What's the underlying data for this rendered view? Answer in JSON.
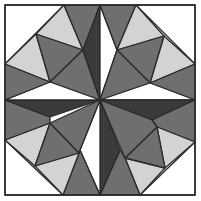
{
  "colors": {
    "white": "#ffffff",
    "light": "#d3d3d3",
    "medium": "#6f6f6f",
    "dark": "#3b3b3b",
    "line": "#2a2a2a"
  },
  "frame": {
    "x": 5,
    "y": 5,
    "w": 190,
    "h": 190
  },
  "triangles": [
    {
      "region": "tl-corner",
      "fill": "white",
      "points": "5,5 64,5 5,64"
    },
    {
      "region": "tl-light-top",
      "fill": "light",
      "points": "64,5 36,34 83,50"
    },
    {
      "region": "tl-light-left",
      "fill": "light",
      "points": "5,64 36,34 50,82"
    },
    {
      "region": "tl-mid",
      "fill": "medium",
      "points": "36,34 83,50 50,82"
    },
    {
      "region": "tl-inner",
      "fill": "medium",
      "points": "83,50 50,82 100,100"
    },
    {
      "region": "top-gray-left",
      "fill": "medium",
      "points": "64,5 100,5 83,50"
    },
    {
      "region": "top-dark",
      "fill": "dark",
      "points": "100,5 83,50 100,100"
    },
    {
      "region": "top-white",
      "fill": "white",
      "points": "100,5 100,100 117,50"
    },
    {
      "region": "top-gray-right",
      "fill": "medium",
      "points": "100,5 136,5 117,50"
    },
    {
      "region": "tr-corner",
      "fill": "white",
      "points": "136,5 195,5 195,64"
    },
    {
      "region": "tr-light-top",
      "fill": "light",
      "points": "136,5 164,36 117,50"
    },
    {
      "region": "tr-light-right",
      "fill": "light",
      "points": "195,64 164,36 150,83"
    },
    {
      "region": "tr-mid",
      "fill": "medium",
      "points": "117,50 164,36 150,83"
    },
    {
      "region": "tr-inner",
      "fill": "medium",
      "points": "117,50 150,83 100,100"
    },
    {
      "region": "right-gray-top",
      "fill": "medium",
      "points": "195,64 195,100 150,83"
    },
    {
      "region": "right-white",
      "fill": "white",
      "points": "195,100 150,83 100,100"
    },
    {
      "region": "right-dark",
      "fill": "dark",
      "points": "195,100 100,100 152,120"
    },
    {
      "region": "right-gray-bottom",
      "fill": "medium",
      "points": "195,100 195,142 157,127 152,120"
    },
    {
      "region": "br-corner",
      "fill": "white",
      "points": "195,142 195,195 140,195"
    },
    {
      "region": "br-light-right",
      "fill": "light",
      "points": "157,127 195,142 165,168"
    },
    {
      "region": "br-light-bottom",
      "fill": "light",
      "points": "125,158 165,168 140,195"
    },
    {
      "region": "br-mid",
      "fill": "medium",
      "points": "157,127 165,168 125,158"
    },
    {
      "region": "br-inner",
      "fill": "medium",
      "points": "152,120 157,127 125,158 100,100"
    },
    {
      "region": "bottom-gray-right",
      "fill": "medium",
      "points": "140,195 100,195 120,150 125,158"
    },
    {
      "region": "bottom-dark",
      "fill": "dark",
      "points": "100,195 100,100 120,150"
    },
    {
      "region": "bottom-white",
      "fill": "white",
      "points": "100,195 100,100 80,150"
    },
    {
      "region": "bottom-gray-left",
      "fill": "medium",
      "points": "100,195 63,195 79,153 80,150"
    },
    {
      "region": "bl-corner",
      "fill": "white",
      "points": "5,140 63,195 5,195"
    },
    {
      "region": "bl-light-left",
      "fill": "light",
      "points": "5,140 50,123 35,166"
    },
    {
      "region": "bl-light-bottom",
      "fill": "light",
      "points": "35,166 79,153 63,195"
    },
    {
      "region": "bl-mid",
      "fill": "medium",
      "points": "50,123 79,153 35,166"
    },
    {
      "region": "bl-inner",
      "fill": "medium",
      "points": "50,123 79,153 80,150 100,100"
    },
    {
      "region": "left-gray-bottom",
      "fill": "medium",
      "points": "5,100 5,140 50,123 50,117"
    },
    {
      "region": "left-dark",
      "fill": "dark",
      "points": "5,100 100,100 50,117"
    },
    {
      "region": "left-white",
      "fill": "white",
      "points": "5,100 50,82 100,100"
    },
    {
      "region": "left-gray-top",
      "fill": "medium",
      "points": "5,64 5,100 50,82"
    }
  ]
}
